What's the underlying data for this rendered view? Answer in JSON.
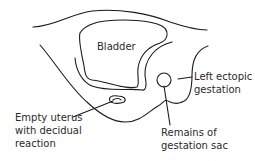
{
  "diagram": {
    "type": "anatomical-line-drawing",
    "labels": {
      "bladder": "Bladder",
      "ectopic": [
        "Left ectopic",
        "gestation"
      ],
      "uterus": [
        "Empty uterus",
        "with decidual",
        "reaction"
      ],
      "sac": [
        "Remains of",
        "gestation sac"
      ]
    },
    "colors": {
      "line": "#1a1a1a",
      "text": "#2a2a2a",
      "background": "#ffffff"
    }
  }
}
